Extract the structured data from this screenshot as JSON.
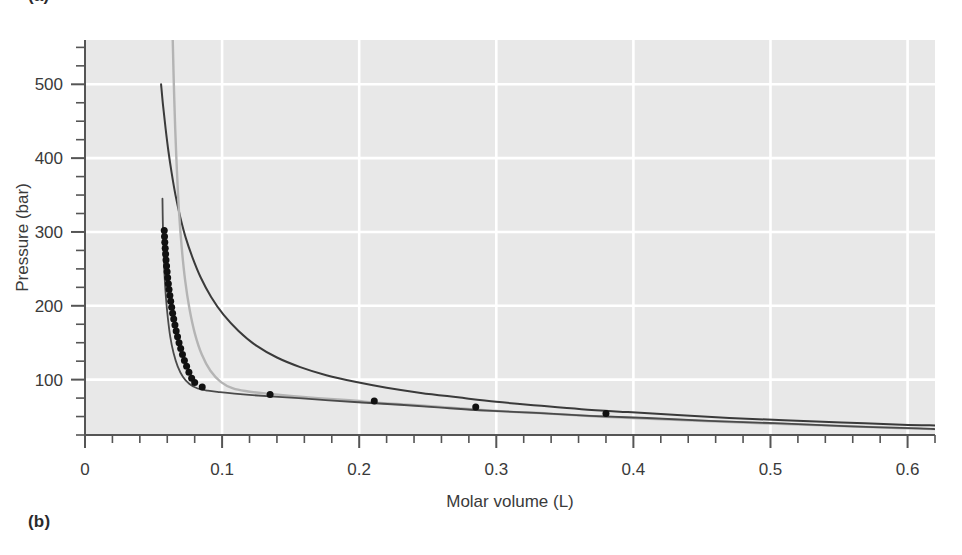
{
  "figure": {
    "panel_a_label": "(a)",
    "panel_b_label": "(b)"
  },
  "chart_data": {
    "type": "line",
    "title": "",
    "xlabel": "Molar volume (L)",
    "ylabel": "Pressure (bar)",
    "xlim": [
      0,
      0.62
    ],
    "ylim": [
      25,
      560
    ],
    "xticks": [
      0,
      0.1,
      0.2,
      0.3,
      0.4,
      0.5,
      0.6
    ],
    "xticklabels": [
      "0",
      "0.1",
      "0.2",
      "0.3",
      "0.4",
      "0.5",
      "0.6"
    ],
    "x_minor_step": 0.02,
    "yticks": [
      100,
      200,
      300,
      400,
      500
    ],
    "yticklabels": [
      "100",
      "200",
      "300",
      "400",
      "500"
    ],
    "y_minor_step": 25,
    "grid": true,
    "grid_color": "#ffffff",
    "plot_background": "#e8e8e8",
    "legend": "none",
    "series": [
      {
        "name": "upper-isotherm-dark",
        "color": "#3a3a3a",
        "linewidth": 2.0,
        "style": "line",
        "points": [
          [
            0.0555,
            500
          ],
          [
            0.057,
            470
          ],
          [
            0.0588,
            440
          ],
          [
            0.0608,
            410
          ],
          [
            0.0632,
            380
          ],
          [
            0.066,
            350
          ],
          [
            0.0695,
            320
          ],
          [
            0.0735,
            292
          ],
          [
            0.0785,
            265
          ],
          [
            0.0845,
            238
          ],
          [
            0.092,
            212
          ],
          [
            0.101,
            188
          ],
          [
            0.112,
            166
          ],
          [
            0.125,
            146
          ],
          [
            0.14,
            130
          ],
          [
            0.157,
            117
          ],
          [
            0.176,
            106
          ],
          [
            0.197,
            97
          ],
          [
            0.22,
            89
          ],
          [
            0.245,
            82
          ],
          [
            0.272,
            76
          ],
          [
            0.3,
            70
          ],
          [
            0.33,
            65
          ],
          [
            0.362,
            60
          ],
          [
            0.396,
            56
          ],
          [
            0.432,
            52
          ],
          [
            0.47,
            48
          ],
          [
            0.51,
            45
          ],
          [
            0.552,
            42
          ],
          [
            0.596,
            39
          ],
          [
            0.62,
            38
          ]
        ]
      },
      {
        "name": "light-gray-isotherm",
        "color": "#b4b4b4",
        "linewidth": 2.4,
        "style": "line",
        "points": [
          [
            0.064,
            560
          ],
          [
            0.0648,
            500
          ],
          [
            0.0658,
            440
          ],
          [
            0.067,
            385
          ],
          [
            0.0685,
            330
          ],
          [
            0.0705,
            280
          ],
          [
            0.073,
            235
          ],
          [
            0.0762,
            196
          ],
          [
            0.0802,
            162
          ],
          [
            0.0852,
            134
          ],
          [
            0.0915,
            112
          ],
          [
            0.099,
            97
          ],
          [
            0.108,
            88
          ],
          [
            0.119,
            84
          ],
          [
            0.133,
            81
          ],
          [
            0.15,
            78
          ],
          [
            0.17,
            75
          ],
          [
            0.193,
            72
          ],
          [
            0.218,
            68
          ],
          [
            0.245,
            65
          ],
          [
            0.274,
            61
          ],
          [
            0.305,
            57
          ],
          [
            0.338,
            54
          ],
          [
            0.374,
            50
          ],
          [
            0.412,
            47
          ],
          [
            0.452,
            44
          ],
          [
            0.494,
            41
          ],
          [
            0.538,
            38
          ],
          [
            0.584,
            35
          ],
          [
            0.62,
            33
          ]
        ]
      },
      {
        "name": "middle-isotherm-dark",
        "color": "#4a4a4a",
        "linewidth": 1.8,
        "style": "line",
        "points": [
          [
            0.0565,
            345
          ],
          [
            0.0568,
            310
          ],
          [
            0.0573,
            275
          ],
          [
            0.058,
            242
          ],
          [
            0.059,
            212
          ],
          [
            0.0604,
            184
          ],
          [
            0.0622,
            158
          ],
          [
            0.0646,
            136
          ],
          [
            0.0676,
            118
          ],
          [
            0.0714,
            104
          ],
          [
            0.0762,
            94
          ],
          [
            0.0822,
            88
          ],
          [
            0.0896,
            85
          ],
          [
            0.0985,
            83
          ],
          [
            0.109,
            81
          ],
          [
            0.122,
            79
          ],
          [
            0.138,
            77
          ],
          [
            0.156,
            75
          ],
          [
            0.178,
            72
          ],
          [
            0.202,
            69
          ],
          [
            0.23,
            66
          ],
          [
            0.26,
            62
          ],
          [
            0.293,
            58
          ],
          [
            0.329,
            55
          ],
          [
            0.368,
            51
          ],
          [
            0.41,
            48
          ],
          [
            0.455,
            44
          ],
          [
            0.503,
            41
          ],
          [
            0.554,
            37
          ],
          [
            0.608,
            34
          ],
          [
            0.62,
            33
          ]
        ]
      }
    ],
    "markers": {
      "name": "coexistence-points",
      "color": "#111111",
      "size": 7,
      "shape": "circle",
      "dense_branch": [
        [
          0.0578,
          302
        ],
        [
          0.058,
          294
        ],
        [
          0.0582,
          286
        ],
        [
          0.0585,
          278
        ],
        [
          0.0588,
          270
        ],
        [
          0.0591,
          262
        ],
        [
          0.0595,
          254
        ],
        [
          0.0599,
          246
        ],
        [
          0.0603,
          238
        ],
        [
          0.0608,
          230
        ],
        [
          0.0613,
          222
        ],
        [
          0.0619,
          214
        ],
        [
          0.0625,
          206
        ],
        [
          0.0632,
          198
        ],
        [
          0.0639,
          190
        ],
        [
          0.0647,
          182
        ],
        [
          0.0656,
          174
        ],
        [
          0.0665,
          166
        ],
        [
          0.0675,
          158
        ],
        [
          0.0686,
          150
        ],
        [
          0.0698,
          142
        ],
        [
          0.0711,
          134
        ],
        [
          0.0725,
          126
        ],
        [
          0.0741,
          118
        ],
        [
          0.0758,
          110
        ],
        [
          0.0778,
          102
        ],
        [
          0.08,
          96
        ]
      ],
      "sparse_branch": [
        [
          0.0855,
          90
        ],
        [
          0.135,
          80
        ],
        [
          0.211,
          71
        ],
        [
          0.285,
          63
        ],
        [
          0.38,
          54
        ]
      ]
    }
  }
}
